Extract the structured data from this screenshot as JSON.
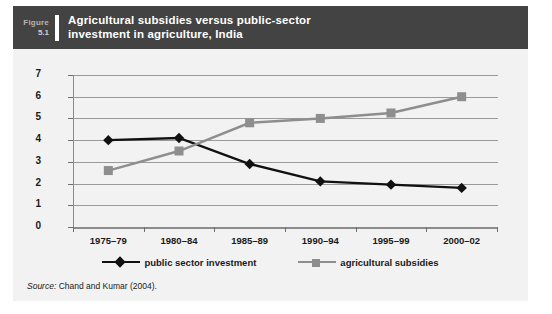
{
  "figure": {
    "number_word": "Figure",
    "number": "5.1",
    "title_line1": "Agricultural subsidies versus public-sector",
    "title_line2": "investment in agriculture, India",
    "source_label": "Source:",
    "source_text": "Chand and Kumar (2004).",
    "header_bg": "#434343",
    "card_bg": "#f2f2f2"
  },
  "chart_data": {
    "type": "line",
    "title": "Agricultural subsidies versus public-sector investment in agriculture, India",
    "xlabel": "",
    "ylabel": "",
    "categories": [
      "1975–79",
      "1980–84",
      "1985–89",
      "1990–94",
      "1995–99",
      "2000–02"
    ],
    "ylim": [
      0,
      7
    ],
    "yticks": [
      "0",
      "1",
      "2",
      "3",
      "4",
      "5",
      "6",
      "7"
    ],
    "grid": true,
    "legend_position": "bottom",
    "series": [
      {
        "name": "public sector investment",
        "color": "#111111",
        "marker": "diamond",
        "values": [
          4.0,
          4.1,
          2.9,
          2.1,
          1.95,
          1.8
        ]
      },
      {
        "name": "agricultural subsidies",
        "color": "#8e8e8e",
        "marker": "square",
        "values": [
          2.6,
          3.5,
          4.8,
          5.0,
          5.25,
          6.0
        ]
      }
    ]
  }
}
